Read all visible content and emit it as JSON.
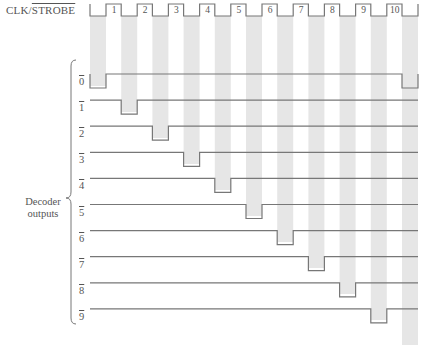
{
  "clock": {
    "label_main": "CLK/",
    "label_overbar": "STROBE",
    "pulses": [
      "1",
      "2",
      "3",
      "4",
      "5",
      "6",
      "7",
      "8",
      "9",
      "10"
    ]
  },
  "decoder": {
    "group_label_line1": "Decoder",
    "group_label_line2": "outputs",
    "outputs": [
      "0",
      "1",
      "2",
      "3",
      "4",
      "5",
      "6",
      "7",
      "8",
      "9"
    ]
  },
  "colors": {
    "line": "#777777",
    "shade": "#e6e6e6",
    "text": "#555555"
  },
  "chart_data": {
    "type": "timing-diagram",
    "title": "",
    "signals": [
      {
        "name": "CLK/STROBE",
        "kind": "clock",
        "pulses": 10
      },
      {
        "name": "0̅",
        "low_during_clock_low_intervals": [
          0,
          10
        ]
      },
      {
        "name": "1̅",
        "low_during_clock_low_intervals": [
          1
        ]
      },
      {
        "name": "2̅",
        "low_during_clock_low_intervals": [
          2
        ]
      },
      {
        "name": "3̅",
        "low_during_clock_low_intervals": [
          3
        ]
      },
      {
        "name": "4̅",
        "low_during_clock_low_intervals": [
          4
        ]
      },
      {
        "name": "5̅",
        "low_during_clock_low_intervals": [
          5
        ]
      },
      {
        "name": "6̅",
        "low_during_clock_low_intervals": [
          6
        ]
      },
      {
        "name": "7̅",
        "low_during_clock_low_intervals": [
          7
        ]
      },
      {
        "name": "8̅",
        "low_during_clock_low_intervals": [
          8
        ]
      },
      {
        "name": "9̅",
        "low_during_clock_low_intervals": [
          9
        ]
      }
    ],
    "annotation": "Decoder outputs"
  }
}
